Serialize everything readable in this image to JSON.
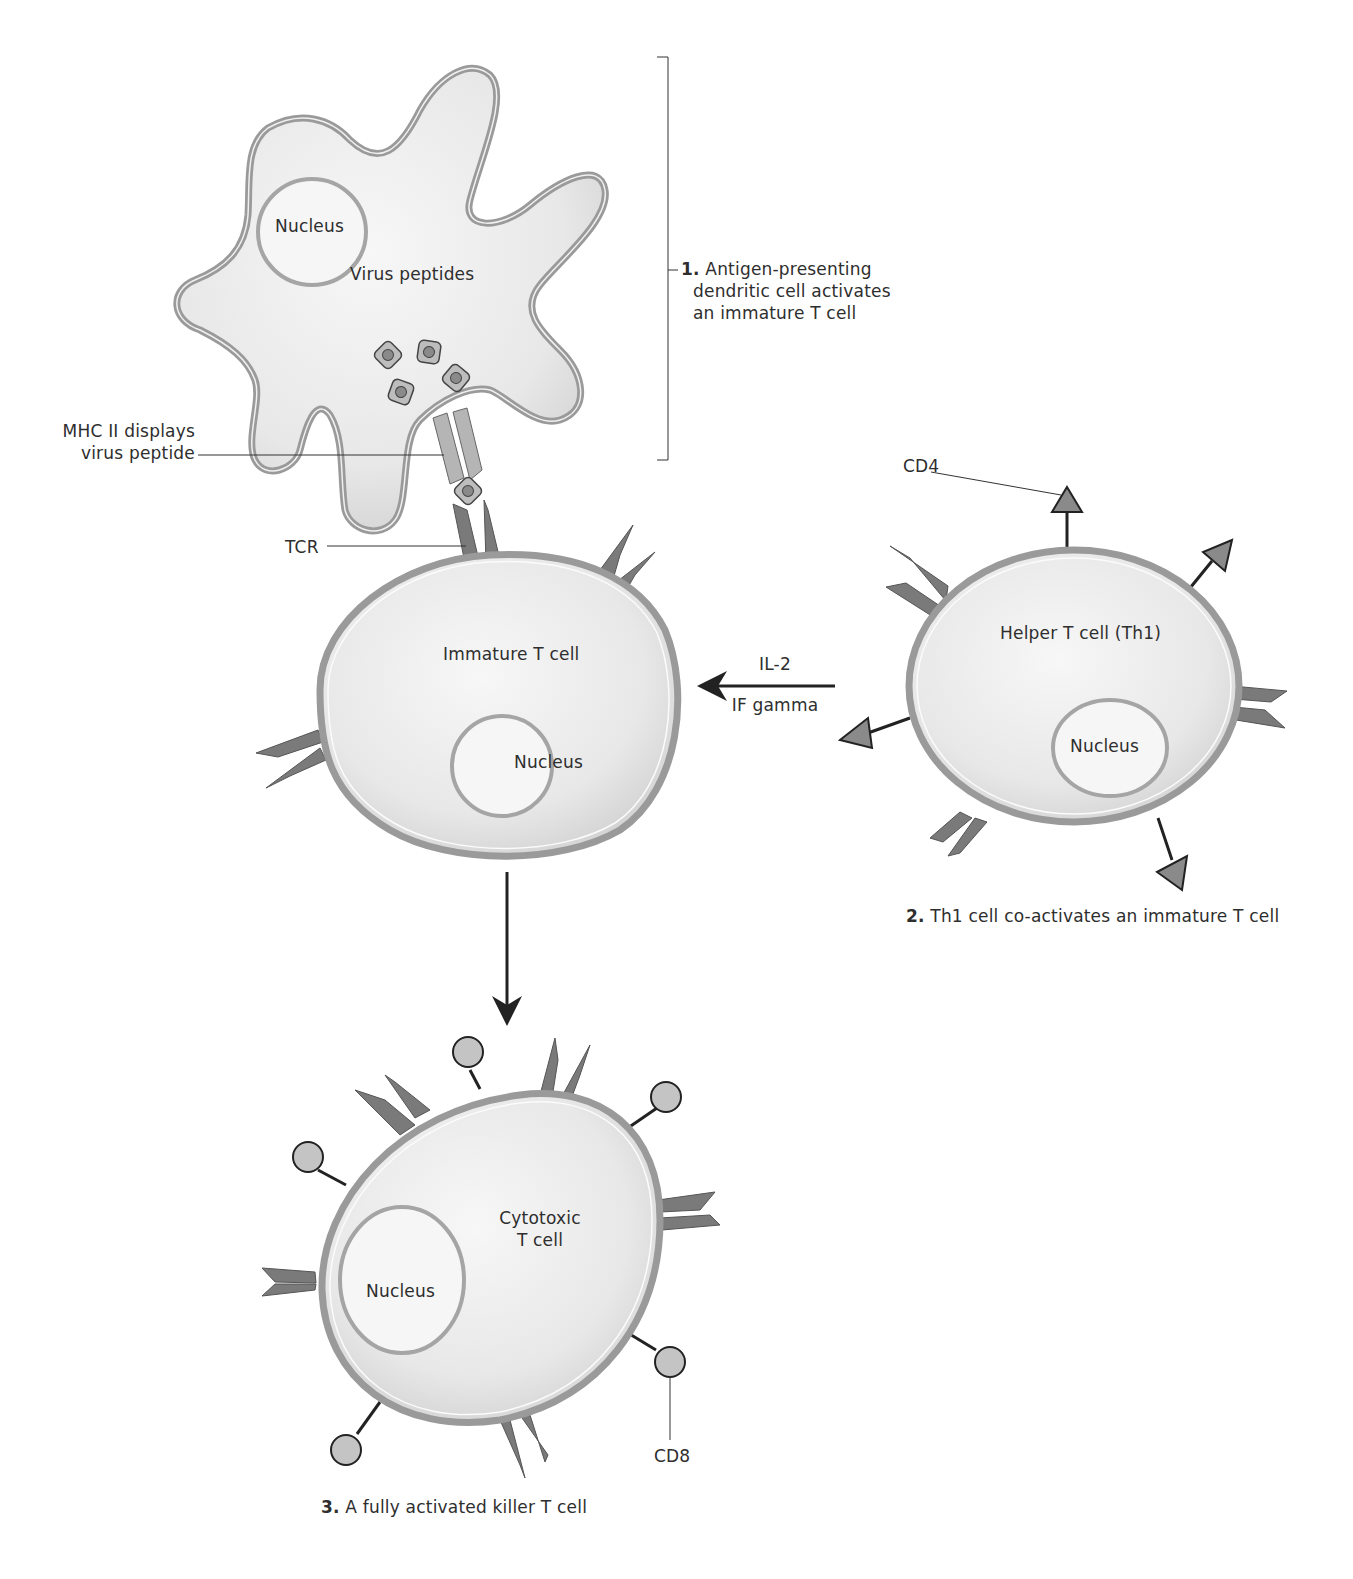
{
  "diagram": {
    "colors": {
      "cell_fill": "#e6e6e6",
      "cell_membrane": "#9a9a9a",
      "membrane_highlight": "#f8f8f8",
      "receptor_dark": "#7a7a7a",
      "receptor_light": "#b5b5b5",
      "peptide_fill": "#bdbdbd",
      "peptide_core": "#8a8a8a",
      "cd8_fill": "#c4c4c4",
      "line": "#222222",
      "text": "#2e2e2e"
    },
    "cells": {
      "dendritic": {
        "nucleus_label": "Nucleus",
        "content_label": "Virus peptides"
      },
      "immature": {
        "label": "Immature T cell",
        "nucleus_label": "Nucleus"
      },
      "helper": {
        "label": "Helper T cell (Th1)",
        "nucleus_label": "Nucleus"
      },
      "cytotoxic": {
        "label_line1": "Cytotoxic",
        "label_line2": "T cell",
        "nucleus_label": "Nucleus"
      }
    },
    "callouts": {
      "mhc_line1": "MHC II displays",
      "mhc_line2": "virus peptide",
      "tcr": "TCR",
      "cd4": "CD4",
      "cd8": "CD8",
      "cytokine_1": "IL-2",
      "cytokine_2": "IF gamma"
    },
    "steps": [
      {
        "number": "1.",
        "lines": [
          "Antigen-presenting",
          "dendritic cell activates",
          "an immature T cell"
        ]
      },
      {
        "number": "2.",
        "text": "Th1 cell co-activates an immature T cell"
      },
      {
        "number": "3.",
        "text": "A fully activated killer T cell"
      }
    ]
  }
}
